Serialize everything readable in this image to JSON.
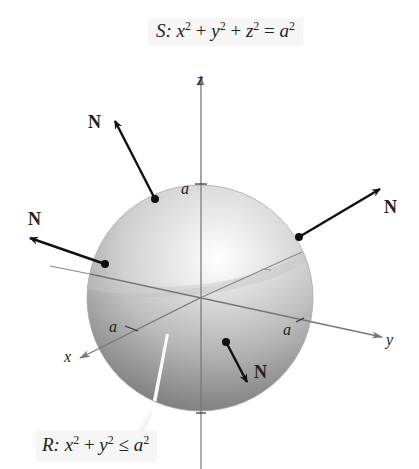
{
  "surface_label": {
    "name": "S",
    "equation_parts": [
      "S:",
      "x",
      "2",
      " + ",
      "y",
      "2",
      " + ",
      "z",
      "2",
      " = ",
      "a",
      "2"
    ]
  },
  "region_label": {
    "name": "R",
    "equation_parts": [
      "R:",
      "x",
      "2",
      " + ",
      "y",
      "2",
      " ≤ ",
      "a",
      "2"
    ]
  },
  "axes": {
    "x": "x",
    "y": "y",
    "z": "z"
  },
  "radius_ticks": {
    "z_top": "a",
    "x": "a",
    "y": "a"
  },
  "normal_vectors": [
    {
      "label": "N",
      "position": "upper-left"
    },
    {
      "label": "N",
      "position": "upper-right"
    },
    {
      "label": "N",
      "position": "left"
    },
    {
      "label": "N",
      "position": "lower-front"
    }
  ],
  "colors": {
    "sphere_highlight": "#ffffff",
    "sphere_mid": "#d0d0d0",
    "sphere_edge": "#9a9a9a",
    "disk_shade": "#a8a8a8",
    "axis": "#777777",
    "vector": "#111111"
  }
}
